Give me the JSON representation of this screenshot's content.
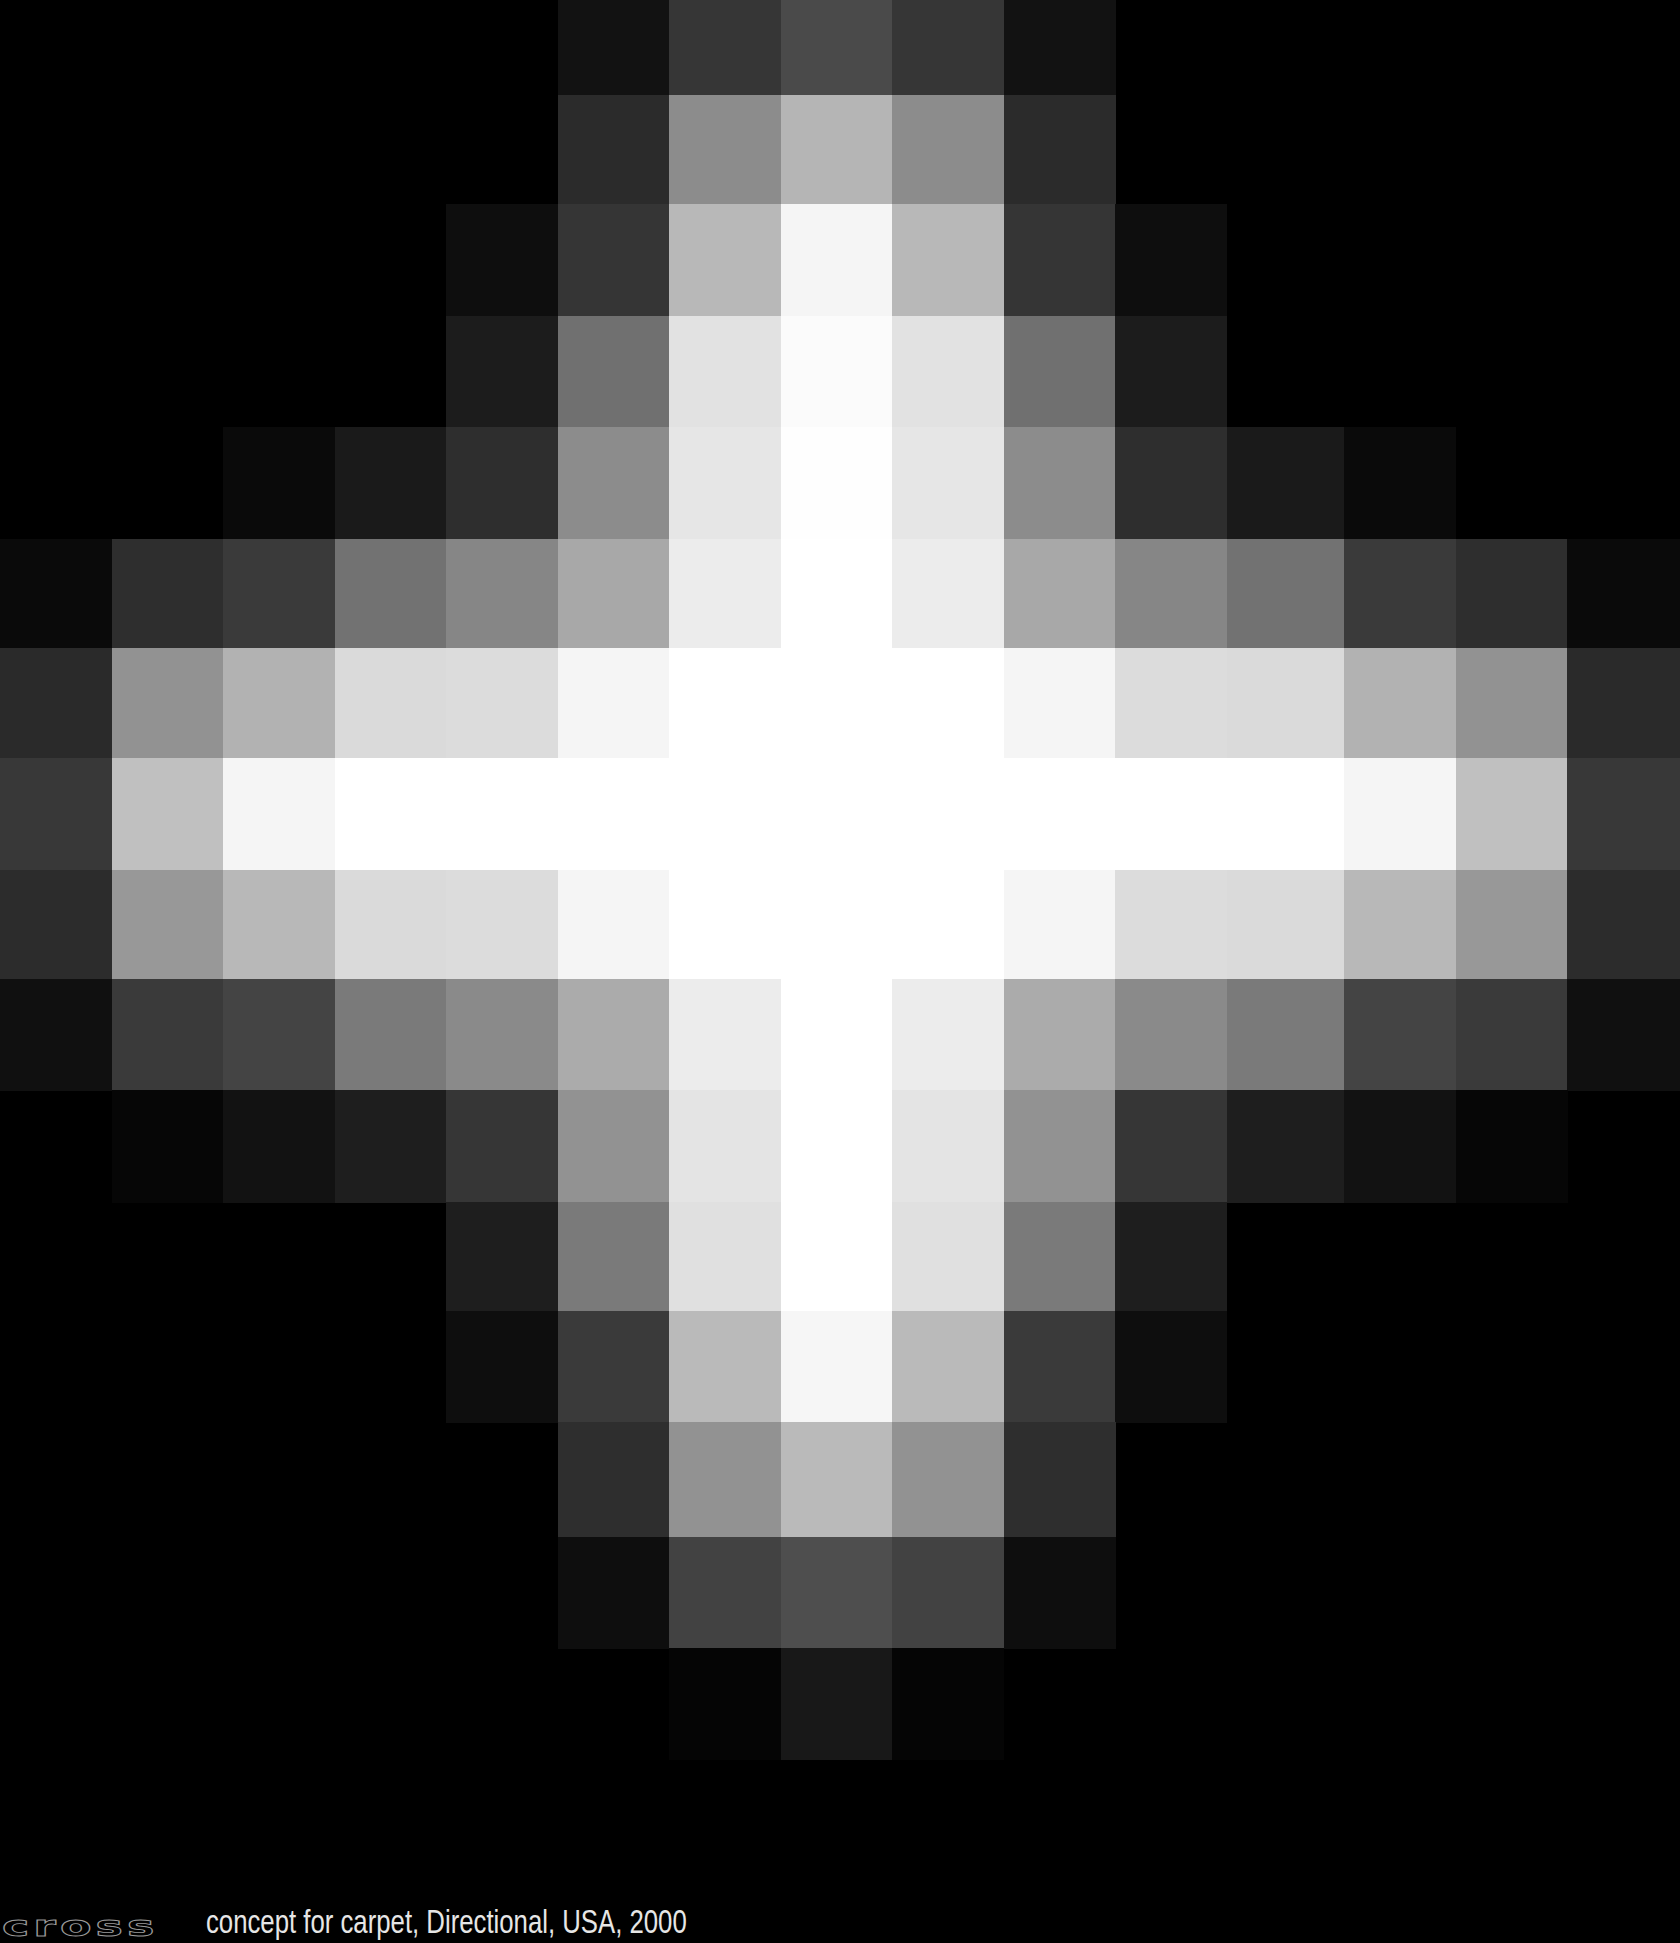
{
  "artwork": {
    "title": "cross",
    "description": "concept for carpet, Directional, USA, 2000",
    "grid": {
      "columns": 15,
      "rows": 16,
      "col_edges": [
        0,
        111.5,
        223,
        334.5,
        446,
        557.5,
        669,
        780.5,
        892,
        1003.5,
        1115,
        1226.5,
        1344,
        1455.5,
        1567,
        1679
      ],
      "row_edges": [
        0,
        95,
        204,
        316,
        427,
        539,
        648,
        758,
        870,
        979,
        1090,
        1202,
        1311,
        1422,
        1537,
        1648,
        1759
      ],
      "background": "#000000",
      "cells": [
        [
          "#000000",
          "#000000",
          "#000000",
          "#000000",
          "#000000",
          "#121212",
          "#363636",
          "#4a4a4a",
          "#363636",
          "#121212",
          "#000000",
          "#000000",
          "#000000",
          "#000000",
          "#000000"
        ],
        [
          "#000000",
          "#000000",
          "#000000",
          "#000000",
          "#000000",
          "#2b2b2b",
          "#8c8c8c",
          "#b5b5b5",
          "#8c8c8c",
          "#2b2b2b",
          "#000000",
          "#000000",
          "#000000",
          "#000000",
          "#000000"
        ],
        [
          "#000000",
          "#000000",
          "#000000",
          "#000000",
          "#0e0e0e",
          "#353535",
          "#b8b8b8",
          "#f5f5f5",
          "#b8b8b8",
          "#353535",
          "#0e0e0e",
          "#000000",
          "#000000",
          "#000000",
          "#000000"
        ],
        [
          "#000000",
          "#000000",
          "#000000",
          "#000000",
          "#1c1c1c",
          "#707070",
          "#e2e2e2",
          "#fbfbfb",
          "#e2e2e2",
          "#707070",
          "#1c1c1c",
          "#000000",
          "#000000",
          "#000000",
          "#000000"
        ],
        [
          "#000000",
          "#000000",
          "#0a0a0a",
          "#1a1a1a",
          "#2e2e2e",
          "#8c8c8c",
          "#e6e6e6",
          "#fefefe",
          "#e6e6e6",
          "#8c8c8c",
          "#2e2e2e",
          "#1a1a1a",
          "#0a0a0a",
          "#000000",
          "#000000"
        ],
        [
          "#0a0a0a",
          "#2e2e2e",
          "#3a3a3a",
          "#727272",
          "#868686",
          "#a8a8a8",
          "#ececec",
          "#ffffff",
          "#ececec",
          "#a8a8a8",
          "#868686",
          "#727272",
          "#3a3a3a",
          "#2e2e2e",
          "#0a0a0a"
        ],
        [
          "#2a2a2a",
          "#929292",
          "#b2b2b2",
          "#dadada",
          "#dcdcdc",
          "#f5f5f5",
          "#ffffff",
          "#ffffff",
          "#ffffff",
          "#f5f5f5",
          "#dcdcdc",
          "#dadada",
          "#b2b2b2",
          "#929292",
          "#2a2a2a"
        ],
        [
          "#383838",
          "#c0c0c0",
          "#f5f5f5",
          "#ffffff",
          "#ffffff",
          "#ffffff",
          "#ffffff",
          "#ffffff",
          "#ffffff",
          "#ffffff",
          "#ffffff",
          "#ffffff",
          "#f5f5f5",
          "#c0c0c0",
          "#383838"
        ],
        [
          "#2c2c2c",
          "#989898",
          "#b8b8b8",
          "#dadada",
          "#dcdcdc",
          "#f5f5f5",
          "#ffffff",
          "#ffffff",
          "#ffffff",
          "#f5f5f5",
          "#dcdcdc",
          "#dadada",
          "#b8b8b8",
          "#989898",
          "#2c2c2c"
        ],
        [
          "#101010",
          "#3a3a3a",
          "#444444",
          "#7a7a7a",
          "#8a8a8a",
          "#ababab",
          "#ececec",
          "#ffffff",
          "#ececec",
          "#ababab",
          "#8a8a8a",
          "#7a7a7a",
          "#444444",
          "#3a3a3a",
          "#101010"
        ],
        [
          "#000000",
          "#060606",
          "#121212",
          "#1e1e1e",
          "#363636",
          "#929292",
          "#e4e4e4",
          "#ffffff",
          "#e4e4e4",
          "#929292",
          "#363636",
          "#1e1e1e",
          "#121212",
          "#060606",
          "#000000"
        ],
        [
          "#000000",
          "#000000",
          "#000000",
          "#000000",
          "#1e1e1e",
          "#7a7a7a",
          "#e0e0e0",
          "#ffffff",
          "#e0e0e0",
          "#7a7a7a",
          "#1e1e1e",
          "#000000",
          "#000000",
          "#000000",
          "#000000"
        ],
        [
          "#000000",
          "#000000",
          "#000000",
          "#000000",
          "#0e0e0e",
          "#3a3a3a",
          "#bababa",
          "#f6f6f6",
          "#bababa",
          "#3a3a3a",
          "#0e0e0e",
          "#000000",
          "#000000",
          "#000000",
          "#000000"
        ],
        [
          "#000000",
          "#000000",
          "#000000",
          "#000000",
          "#000000",
          "#2e2e2e",
          "#929292",
          "#bababa",
          "#929292",
          "#2e2e2e",
          "#000000",
          "#000000",
          "#000000",
          "#000000",
          "#000000"
        ],
        [
          "#000000",
          "#000000",
          "#000000",
          "#000000",
          "#000000",
          "#0e0e0e",
          "#424242",
          "#4e4e4e",
          "#424242",
          "#0e0e0e",
          "#000000",
          "#000000",
          "#000000",
          "#000000",
          "#000000"
        ],
        [
          "#000000",
          "#000000",
          "#000000",
          "#000000",
          "#000000",
          "#000000",
          "#050505",
          "#181818",
          "#050505",
          "#000000",
          "#000000",
          "#000000",
          "#000000",
          "#000000",
          "#000000"
        ]
      ]
    }
  }
}
